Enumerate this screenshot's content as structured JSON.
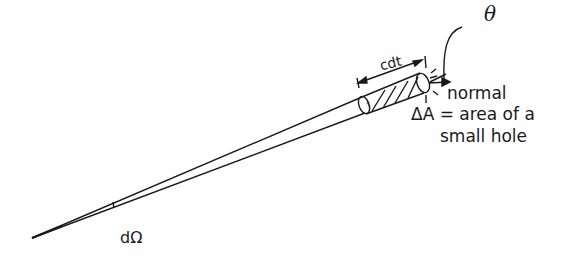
{
  "diagram": {
    "type": "cone-with-cylinder",
    "labels": {
      "theta": "θ",
      "length": "cdt",
      "normal": "normal",
      "area_line1": "ΔA = area of a",
      "area_line2": "small hole",
      "solid_angle": "dΩ"
    },
    "colors": {
      "stroke": "#1a1a1a",
      "background": "#ffffff"
    }
  }
}
